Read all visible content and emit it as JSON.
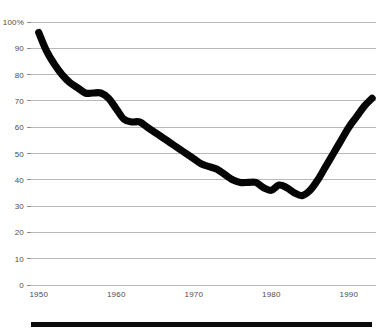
{
  "chart_data": {
    "type": "line",
    "title": "",
    "subtitle": "",
    "xlabel": "",
    "ylabel": "",
    "xlim": [
      1949,
      1993.5
    ],
    "ylim": [
      0,
      100
    ],
    "grid": true,
    "legend_position": "none",
    "x_ticks": [
      1950,
      1960,
      1970,
      1980,
      1990
    ],
    "x_tick_labels": [
      "1950",
      "1960",
      "1970",
      "1980",
      "1990"
    ],
    "y_ticks": [
      0,
      10,
      20,
      30,
      40,
      50,
      60,
      70,
      80,
      90,
      100
    ],
    "y_tick_labels": [
      "0",
      "10",
      "20",
      "30",
      "40",
      "50",
      "60",
      "70",
      "80",
      "90",
      "100%"
    ],
    "series": [
      {
        "name": "share",
        "color": "#050505",
        "x": [
          1950,
          1951,
          1952,
          1953,
          1954,
          1955,
          1956,
          1957,
          1958,
          1959,
          1960,
          1961,
          1962,
          1963,
          1964,
          1965,
          1966,
          1967,
          1968,
          1969,
          1970,
          1971,
          1972,
          1973,
          1974,
          1975,
          1976,
          1977,
          1978,
          1979,
          1980,
          1981,
          1982,
          1983,
          1984,
          1985,
          1986,
          1987,
          1988,
          1989,
          1990,
          1991,
          1992,
          1993
        ],
        "values": [
          96,
          89,
          84,
          80,
          77,
          75,
          73,
          73,
          73,
          71,
          67,
          63,
          62,
          62,
          60,
          58,
          56,
          54,
          52,
          50,
          48,
          46,
          45,
          44,
          42,
          40,
          39,
          39,
          39,
          37,
          36,
          38,
          37,
          35,
          34,
          36,
          40,
          45,
          50,
          55,
          60,
          64,
          68,
          71
        ]
      }
    ]
  },
  "figure": {
    "bottom_rule_label": "bottom-rule",
    "background_color": "#ffffff",
    "grid_color": "#9a9a9a",
    "line_color": "#050505",
    "tick_text_color": "#4d4d4d"
  }
}
